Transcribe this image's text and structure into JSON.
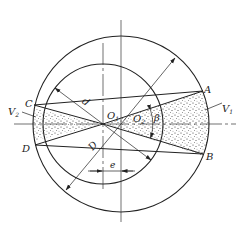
{
  "diagram": {
    "type": "eccentric-circles-geometry",
    "colors": {
      "stroke": "#222222",
      "background": "#ffffff",
      "stipple": "#333333"
    },
    "labels": {
      "A": "A",
      "B": "B",
      "C": "C",
      "D_point": "D",
      "V1": "V",
      "V1_sub": "1",
      "V2": "V",
      "V2_sub": "2",
      "O1": "O",
      "O1_sub": "1",
      "O2": "O",
      "O2_sub": "2",
      "beta": "β",
      "inner_diameter": "d",
      "outer_diameter": "D",
      "eccentricity": "e"
    }
  }
}
